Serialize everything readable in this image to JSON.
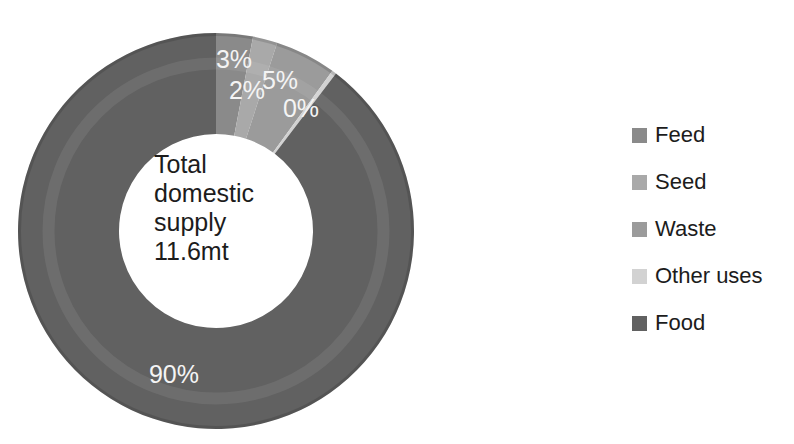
{
  "figure": {
    "background": "#ffffff"
  },
  "chart_data": {
    "type": "pie",
    "subtype": "donut",
    "title": "",
    "center_label": "Total\ndomestic\nsupply\n11.6mt",
    "total_label": "Total domestic supply",
    "total_value": "11.6mt",
    "categories": [
      "Feed",
      "Seed",
      "Waste",
      "Other uses",
      "Food"
    ],
    "values": [
      3,
      2,
      5,
      0,
      90
    ],
    "unit": "%",
    "colors": [
      "#8a8a8a",
      "#a9a9a9",
      "#9b9b9b",
      "#d2d2d2",
      "#616161"
    ],
    "slice_labels": [
      {
        "text": "3%",
        "x": 234,
        "y": 59
      },
      {
        "text": "2%",
        "x": 247,
        "y": 90
      },
      {
        "text": "5%",
        "x": 280,
        "y": 80
      },
      {
        "text": "0%",
        "x": 301,
        "y": 108
      },
      {
        "text": "90%",
        "x": 174,
        "y": 374
      }
    ],
    "legend": {
      "position": "right",
      "items": [
        "Feed",
        "Seed",
        "Waste",
        "Other uses",
        "Food"
      ]
    },
    "geometry": {
      "cx": 216,
      "cy": 231,
      "outer_radius": 198,
      "inner_radius": 97,
      "start_angle_deg": 0,
      "clockwise": true,
      "min_sweep_deg": 1.3
    },
    "label_color": "#f4f4f4",
    "center_text_color": "#1c1c1c"
  }
}
